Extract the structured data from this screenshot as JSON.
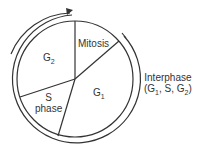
{
  "diagram": {
    "segments": [
      {
        "id": "mitosis",
        "label": "Mitosis"
      },
      {
        "id": "g1",
        "label": "G",
        "sub": "1"
      },
      {
        "id": "s-phase",
        "label_line1": "S",
        "label_line2": "phase"
      },
      {
        "id": "g2",
        "label": "G",
        "sub": "2"
      }
    ],
    "interphase": {
      "label": "Interphase",
      "detail_prefix": "(G",
      "detail_sub1": "1",
      "detail_mid": ", S, G",
      "detail_sub2": "2",
      "detail_suffix": ")"
    },
    "colors": {
      "stroke": "#333333",
      "background": "#ffffff"
    }
  }
}
